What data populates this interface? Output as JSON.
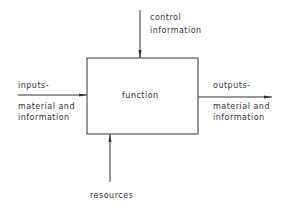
{
  "diagram": {
    "box": {
      "label": "function"
    },
    "control": {
      "line1": "control",
      "line2": "information"
    },
    "inputs": {
      "line1": "inputs-",
      "line2": "material and",
      "line3": "information"
    },
    "outputs": {
      "line1": "outputs-",
      "line2": "material and",
      "line3": "information"
    },
    "resources": {
      "label": "resources"
    },
    "colors": {
      "stroke": "#333333",
      "background": "#ffffff"
    }
  }
}
